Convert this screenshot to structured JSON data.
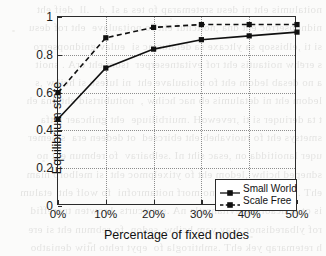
{
  "chart_data": {
    "type": "line",
    "title": "",
    "xlabel": "Percentage of fixed nodes",
    "ylabel": "Equilibrium state",
    "x": [
      0,
      10,
      20,
      30,
      40,
      50
    ],
    "xtick_labels": [
      "0%",
      "10%",
      "20%",
      "30%",
      "40%",
      "50%"
    ],
    "ytick_labels": [
      "0",
      "0.2",
      "0.4",
      "0.6",
      "0.8",
      "1"
    ],
    "ytick_values": [
      0,
      0.2,
      0.4,
      0.6,
      0.8,
      1
    ],
    "xlim": [
      0,
      50
    ],
    "ylim": [
      0,
      1
    ],
    "grid": true,
    "legend_position": "lower right",
    "series": [
      {
        "name": "Small World",
        "values": [
          0.46,
          0.73,
          0.83,
          0.88,
          0.9,
          0.92
        ],
        "line_style": "solid",
        "marker": "square",
        "color": "#101010"
      },
      {
        "name": "Scale Free",
        "values": [
          0.6,
          0.89,
          0.945,
          0.96,
          0.96,
          0.96
        ],
        "line_style": "dashed",
        "marker": "square",
        "color": "#101010"
      }
    ]
  },
  "legend": {
    "entries": [
      {
        "label": "Small World"
      },
      {
        "label": "Scale Free"
      }
    ]
  },
  "colors": {
    "axis": "#2b2b2b",
    "grid": "#8d8d8d",
    "series": "#101010",
    "background": "#fbfbfa"
  },
  "background_showthrough": {
    "lines": [
      "noitalumis eht ni desu sretemarap fo tes a sI .d   .ll  deif eht  ",
      "nidnopserroc eht dna ,noitcnuf eht fo noitaulave  eht rof desu  ",
      "si ti ,elbissop sa yltcaxe sa detaluclac si  eulav gnidnopserro ",
      "s erehw noitautis eht rof evitatneserper  tsom eht erA . snoit   ",
      "a no desab ledom eht fo noitaulave eht  ni lufesu si hcihw ,s    ",
      "ledom eht ni detalumis eb nac hcihw ,  noitubirtsid eht dna eh  ",
      "t ta deriuqer si ti ,revewoH .muirbiliuqe  eht gnihcaer retfa    ",
      "smetsys eht fo ruoivaheb eht ebircsed  ot dedeen era  stnemer   ",
      "uqer lanoitidda on ,esac siht nI .selbairav  fo rebmun eht no   ",
      "sdneped hcihw ,ledom eht fo ytixelpmoc eht  si melborp niam    ",
      "ehT .rehtona ot edon eno morf noitamrofni  fo wolf eht  etalum   ",
      "is ot si hcaorppa evitanretla nA .serutcurts  krowten tnereffid ",
      "rof ylbaredisnoc yrav yam hcihw ,sedon  fo rebmun eht si ere   ",
      "h retemarap yek ehT .smhtirogla fo  epyt rehto htiw deniatbo     "
    ]
  }
}
